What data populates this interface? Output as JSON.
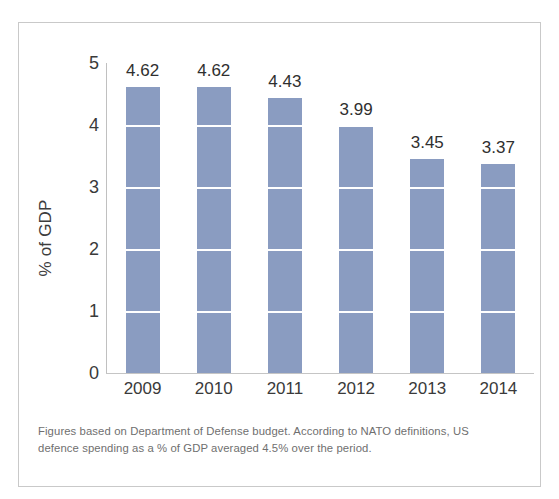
{
  "chart_data": {
    "type": "bar",
    "title": "",
    "subtitle": "",
    "xlabel": "",
    "ylabel": "% of GDP",
    "categories": [
      "2009",
      "2010",
      "2011",
      "2012",
      "2013",
      "2014"
    ],
    "values": [
      4.62,
      4.62,
      4.43,
      3.99,
      3.45,
      3.37
    ],
    "data_labels": [
      "4.62",
      "4.62",
      "4.43",
      "3.99",
      "3.45",
      "3.37"
    ],
    "ylim": [
      0,
      5
    ],
    "yticks": [
      5,
      4,
      3,
      2,
      1,
      0
    ],
    "ytick_labels": [
      "5",
      "4",
      "3",
      "2",
      "1",
      "0"
    ],
    "gridlines": [
      1,
      2,
      3,
      4
    ],
    "grid": true,
    "grid_style": "white horizontal lines over bars",
    "legend": null,
    "bar_color": "#8a9cc1",
    "axis_color": "#c3c3c3",
    "text_color": "#3a3a3a"
  },
  "caption": {
    "text": "Figures based on Department of Defense budget. According to NATO definitions, US defence spending as a % of GDP averaged 4.5% over the period."
  },
  "frame": {
    "border_color": "#c9c9c9",
    "background": "#ffffff"
  }
}
